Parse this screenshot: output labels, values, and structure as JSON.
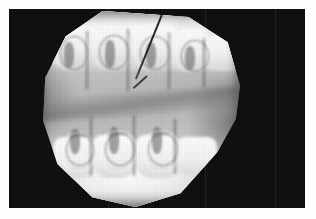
{
  "image": {
    "modality": "dental radiograph",
    "view": "intraoral periapical / bitewing",
    "region": "posterior maxilla and mandible",
    "caption": "",
    "background_color": "#0b0b0b",
    "paper_color": "#fdfdfd",
    "tissue_bright_color": "#fafafa",
    "tissue_mid_color": "#c2c2c2",
    "tissue_dark_color": "#8f8f8f",
    "instrument_color": "#2e2e2e"
  },
  "film": {
    "label": "",
    "field_width": 296,
    "field_height": 199,
    "margin_left": 9,
    "margin_top": 9
  },
  "anatomy": {
    "maxilla_label": "",
    "mandible_label": "",
    "occlusal_plane_label": "",
    "upper_teeth": [
      {
        "id": "upper-1",
        "left": "6%",
        "top": "7%",
        "width": "20%",
        "height": "34%"
      },
      {
        "id": "upper-2",
        "left": "25%",
        "top": "6%",
        "width": "21%",
        "height": "36%"
      },
      {
        "id": "upper-3",
        "left": "45%",
        "top": "7%",
        "width": "21%",
        "height": "35%"
      },
      {
        "id": "upper-4",
        "left": "65%",
        "top": "9%",
        "width": "20%",
        "height": "33%"
      },
      {
        "id": "upper-5",
        "left": "82%",
        "top": "12%",
        "width": "17%",
        "height": "29%"
      }
    ],
    "lower_teeth": [
      {
        "id": "lower-1",
        "left": "8%",
        "top": "52%",
        "width": "21%",
        "height": "33%"
      },
      {
        "id": "lower-2",
        "left": "27%",
        "top": "50%",
        "width": "22%",
        "height": "35%"
      },
      {
        "id": "lower-3",
        "left": "48%",
        "top": "50%",
        "width": "22%",
        "height": "35%"
      },
      {
        "id": "lower-4",
        "left": "68%",
        "top": "52%",
        "width": "20%",
        "height": "32%"
      }
    ]
  },
  "instrument": {
    "name": "radiopaque probe",
    "angle_deg": 22,
    "visible": true
  }
}
